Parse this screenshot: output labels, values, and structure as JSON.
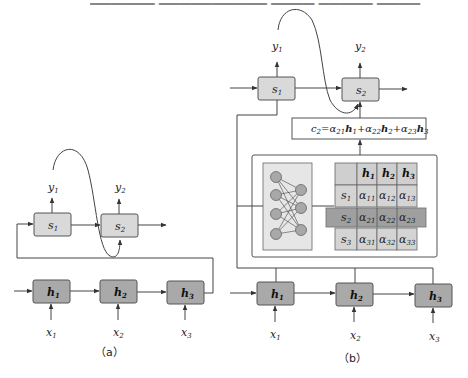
{
  "top_text_cutoff": {
    "visible": true,
    "note_label": ""
  },
  "panel_a": {
    "caption": "（a）",
    "decoder": [
      {
        "state": "s",
        "idx": "1",
        "output": "y",
        "output_idx": "1"
      },
      {
        "state": "s",
        "idx": "2",
        "output": "y",
        "output_idx": "2"
      }
    ],
    "encoder": [
      {
        "state": "h",
        "idx": "1",
        "input": "x",
        "input_idx": "1"
      },
      {
        "state": "h",
        "idx": "2",
        "input": "x",
        "input_idx": "2"
      },
      {
        "state": "h",
        "idx": "3",
        "input": "x",
        "input_idx": "3"
      }
    ]
  },
  "panel_b": {
    "caption": "（b）",
    "decoder": [
      {
        "state": "s",
        "idx": "1",
        "output": "y",
        "output_idx": "1"
      },
      {
        "state": "s",
        "idx": "2",
        "output": "y",
        "output_idx": "2"
      }
    ],
    "context_formula": {
      "lhs": "c",
      "lhs_idx": "2",
      "terms": [
        {
          "alpha_idx": "21",
          "h_idx": "1"
        },
        {
          "alpha_idx": "22",
          "h_idx": "2"
        },
        {
          "alpha_idx": "23",
          "h_idx": "3"
        }
      ]
    },
    "attention_table": {
      "col_headers": [
        {
          "sym": "h",
          "idx": "1"
        },
        {
          "sym": "h",
          "idx": "2"
        },
        {
          "sym": "h",
          "idx": "3"
        }
      ],
      "rows": [
        {
          "sym": "s",
          "idx": "1",
          "cells": [
            "11",
            "12",
            "13"
          ],
          "highlight": false
        },
        {
          "sym": "s",
          "idx": "2",
          "cells": [
            "21",
            "22",
            "23"
          ],
          "highlight": true
        },
        {
          "sym": "s",
          "idx": "3",
          "cells": [
            "31",
            "32",
            "33"
          ],
          "highlight": false
        }
      ],
      "cell_symbol": "α"
    },
    "neural_net": {
      "left_nodes": 4,
      "right_nodes": 3
    },
    "encoder": [
      {
        "state": "h",
        "idx": "1",
        "input": "x",
        "input_idx": "1"
      },
      {
        "state": "h",
        "idx": "2",
        "input": "x",
        "input_idx": "2"
      },
      {
        "state": "h",
        "idx": "3",
        "input": "x",
        "input_idx": "3"
      }
    ]
  },
  "colors": {
    "decoder_box": "#d9d9d9",
    "encoder_box": "#a9a9a9",
    "table_cell": "#d4d4d4",
    "highlight_band": "#8f8f8f",
    "line": "#444444"
  }
}
